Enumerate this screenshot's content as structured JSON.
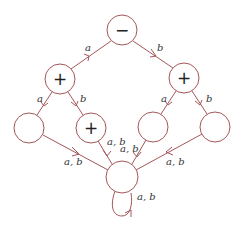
{
  "diagram": {
    "type": "automaton",
    "colors": {
      "stroke": "#a4565a",
      "text": "#222222",
      "background": "#ffffff"
    },
    "nodes": [
      {
        "id": "root",
        "label": "−",
        "cx": 122,
        "cy": 30
      },
      {
        "id": "l",
        "label": "+",
        "cx": 60,
        "cy": 79
      },
      {
        "id": "r",
        "label": "+",
        "cx": 184,
        "cy": 78
      },
      {
        "id": "ll",
        "label": "",
        "cx": 29,
        "cy": 128
      },
      {
        "id": "lr",
        "label": "+",
        "cx": 91,
        "cy": 128
      },
      {
        "id": "rl",
        "label": "",
        "cx": 153,
        "cy": 127
      },
      {
        "id": "rr",
        "label": "",
        "cx": 215,
        "cy": 127
      },
      {
        "id": "sink",
        "label": "",
        "cx": 122,
        "cy": 177
      }
    ],
    "edges": [
      {
        "from": "root",
        "to": "l",
        "label": "a"
      },
      {
        "from": "root",
        "to": "r",
        "label": "b"
      },
      {
        "from": "l",
        "to": "ll",
        "label": "a"
      },
      {
        "from": "l",
        "to": "lr",
        "label": "b"
      },
      {
        "from": "r",
        "to": "rl",
        "label": "a"
      },
      {
        "from": "r",
        "to": "rr",
        "label": "b"
      },
      {
        "from": "ll",
        "to": "sink",
        "label": "a, b"
      },
      {
        "from": "lr",
        "to": "sink",
        "label": "a, b"
      },
      {
        "from": "rl",
        "to": "sink",
        "label": "a, b"
      },
      {
        "from": "rr",
        "to": "sink",
        "label": "a, b"
      },
      {
        "from": "sink",
        "to": "sink",
        "label": "a, b"
      }
    ]
  }
}
